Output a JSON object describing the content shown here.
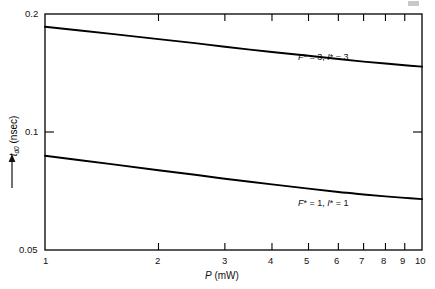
{
  "figure": {
    "background_color": "#ffffff",
    "line_color": "#000000",
    "axis_color": "#000000"
  },
  "axes": {
    "x": {
      "title_symbol": "P",
      "title_units": "(mW)",
      "title_full": "P (mW)",
      "scale": "log",
      "min": 1,
      "max": 10,
      "tick_labels": [
        "1",
        "2",
        "3",
        "4",
        "5",
        "6",
        "7",
        "8",
        "9",
        "10"
      ],
      "tick_values": [
        1,
        2,
        3,
        4,
        5,
        6,
        7,
        8,
        9,
        10
      ]
    },
    "y": {
      "title_symbol": "t",
      "title_subscript": "d0",
      "title_units": "(nsec)",
      "title_full": "t_d0 (nsec)",
      "scale": "log",
      "min": 0.05,
      "max": 0.2,
      "tick_labels": [
        "0.2",
        "0.1",
        "0.05"
      ],
      "tick_values": [
        0.2,
        0.1,
        0.05
      ],
      "arrow_icon": "up-arrow-icon"
    }
  },
  "annotations": [
    {
      "id": "upper",
      "text": "F* = 3, I* = 3",
      "x_data": 6.2,
      "y_data": 0.163
    },
    {
      "id": "lower",
      "text": "F* = 1, I* = 1",
      "x_data": 6.2,
      "y_data": 0.0755
    }
  ],
  "chart_data": {
    "type": "line",
    "title": "",
    "subtitle": "",
    "xlabel": "P (mW)",
    "ylabel": "t_d0 (nsec)",
    "xscale": "log",
    "yscale": "log",
    "xlim": [
      1,
      10
    ],
    "ylim": [
      0.05,
      0.2
    ],
    "grid": false,
    "legend": "inline-annotations",
    "xticks": [
      1,
      2,
      3,
      4,
      5,
      6,
      7,
      8,
      9,
      10
    ],
    "yticks": [
      0.05,
      0.1,
      0.2
    ],
    "series": [
      {
        "name": "F* = 3, I* = 3",
        "x": [
          1,
          1.5,
          2,
          2.5,
          3,
          4,
          5,
          6,
          7,
          8,
          9,
          10
        ],
        "y": [
          0.1855,
          0.178,
          0.1725,
          0.1685,
          0.165,
          0.16,
          0.1565,
          0.1535,
          0.1512,
          0.1495,
          0.148,
          0.1468
        ]
      },
      {
        "name": "F* = 1, I* = 1",
        "x": [
          1,
          1.5,
          2,
          2.5,
          3,
          4,
          5,
          6,
          7,
          8,
          9,
          10
        ],
        "y": [
          0.087,
          0.0828,
          0.0799,
          0.0778,
          0.076,
          0.0735,
          0.0717,
          0.0703,
          0.0693,
          0.0685,
          0.0679,
          0.0674
        ]
      }
    ]
  }
}
